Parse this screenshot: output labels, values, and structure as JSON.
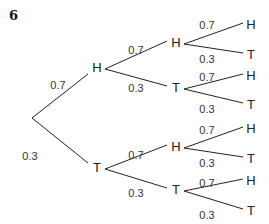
{
  "question_number": "6",
  "tree": {
    "root": {
      "x": 32,
      "y": 118
    },
    "level1": [
      {
        "label": "H",
        "prob": "0.7",
        "x": 97,
        "y": 69,
        "edge_end": [
          88,
          74
        ],
        "prob_pos": [
          58,
          86
        ],
        "child_start": [
          105,
          69
        ]
      },
      {
        "label": "T",
        "prob": "0.3",
        "x": 97,
        "y": 169,
        "edge_end": [
          88,
          163
        ],
        "prob_pos": [
          30,
          157
        ],
        "child_start": [
          105,
          169
        ]
      }
    ],
    "level2": [
      {
        "parent": 0,
        "label": "H",
        "prob": "0.7",
        "x": 176,
        "y": 44,
        "edge_end": [
          167,
          41
        ],
        "prob_pos": [
          136,
          51
        ],
        "child_start": [
          184,
          44
        ]
      },
      {
        "parent": 0,
        "label": "T",
        "prob": "0.3",
        "x": 176,
        "y": 89,
        "edge_end": [
          167,
          86
        ],
        "prob_pos": [
          136,
          89
        ],
        "child_start": [
          184,
          89
        ]
      },
      {
        "parent": 1,
        "label": "H",
        "prob": "0.7",
        "x": 176,
        "y": 148,
        "edge_end": [
          167,
          145
        ],
        "prob_pos": [
          136,
          156
        ],
        "child_start": [
          184,
          148
        ]
      },
      {
        "parent": 1,
        "label": "T",
        "prob": "0.3",
        "x": 176,
        "y": 191,
        "edge_end": [
          167,
          188
        ],
        "prob_pos": [
          136,
          194
        ],
        "child_start": [
          184,
          191
        ]
      }
    ],
    "level3": [
      {
        "parent": 0,
        "label": "H",
        "prob": "0.7",
        "x": 251,
        "y": 26,
        "edge_end": [
          243,
          23
        ],
        "prob_pos": [
          207,
          26
        ]
      },
      {
        "parent": 0,
        "label": "T",
        "prob": "0.3",
        "x": 251,
        "y": 56,
        "edge_end": [
          243,
          53
        ],
        "prob_pos": [
          207,
          60
        ]
      },
      {
        "parent": 1,
        "label": "H",
        "prob": "0.7",
        "x": 251,
        "y": 77,
        "edge_end": [
          243,
          74
        ],
        "prob_pos": [
          207,
          78
        ]
      },
      {
        "parent": 1,
        "label": "T",
        "prob": "0.3",
        "x": 251,
        "y": 106,
        "edge_end": [
          243,
          103
        ],
        "prob_pos": [
          207,
          110
        ]
      },
      {
        "parent": 2,
        "label": "H",
        "prob": "0.7",
        "x": 251,
        "y": 130,
        "edge_end": [
          243,
          127
        ],
        "prob_pos": [
          207,
          131
        ]
      },
      {
        "parent": 2,
        "label": "T",
        "prob": "0.3",
        "x": 251,
        "y": 160,
        "edge_end": [
          243,
          157
        ],
        "prob_pos": [
          207,
          164
        ]
      },
      {
        "parent": 3,
        "label": "H",
        "prob": "0.7",
        "x": 251,
        "y": 182,
        "edge_end": [
          243,
          179
        ],
        "prob_pos": [
          207,
          184
        ]
      },
      {
        "parent": 3,
        "label": "T",
        "prob": "0.3",
        "x": 251,
        "y": 212,
        "edge_end": [
          243,
          209
        ],
        "prob_pos": [
          207,
          216
        ]
      }
    ]
  }
}
